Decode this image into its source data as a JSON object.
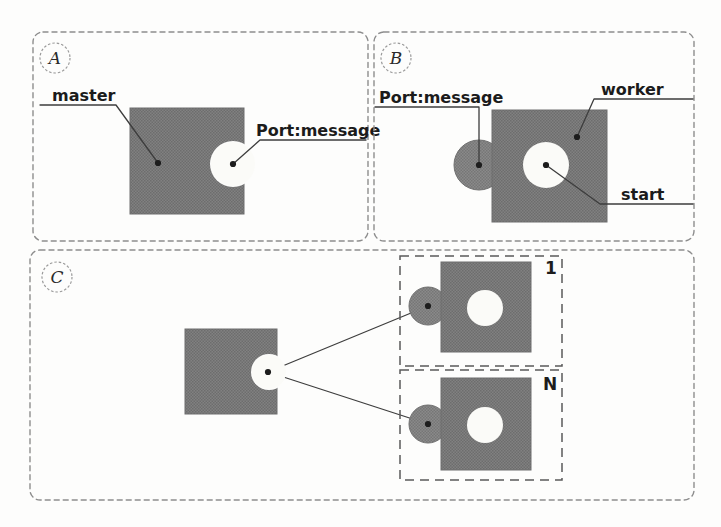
{
  "figure": {
    "type": "hand-drawn-diagram",
    "background_color": "#fdfdfc",
    "fill_color": "#7c7c7c",
    "hole_color": "#fbfbf8",
    "stroke_color": "#3a3a3a"
  },
  "panels": [
    {
      "id": "A",
      "letter": "A",
      "labels": [
        {
          "key": "master",
          "text": "master"
        },
        {
          "key": "port",
          "text": "Port:message"
        }
      ]
    },
    {
      "id": "B",
      "letter": "B",
      "labels": [
        {
          "key": "port",
          "text": "Port:message"
        },
        {
          "key": "worker",
          "text": "worker"
        },
        {
          "key": "start",
          "text": "start"
        }
      ]
    },
    {
      "id": "C",
      "letter": "C",
      "labels": [
        {
          "key": "worker_first",
          "text": "1"
        },
        {
          "key": "worker_last",
          "text": "N"
        }
      ]
    }
  ],
  "shapes": {
    "panel_a_master": "master-block",
    "panel_a_port": "port-message-hole",
    "panel_b_worker": "worker-block",
    "panel_b_port_tab": "port-message-tab",
    "panel_b_start": "start-hole",
    "panel_c_master": "master-block",
    "panel_c_worker_1": "worker-block-1",
    "panel_c_worker_n": "worker-block-n"
  }
}
